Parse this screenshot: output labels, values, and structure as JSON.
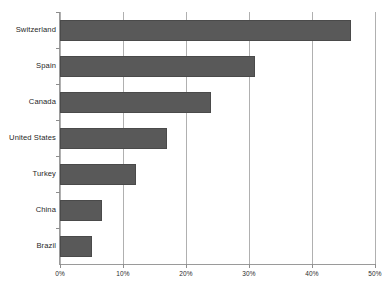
{
  "chart_data": {
    "type": "bar",
    "orientation": "horizontal",
    "title": "",
    "xlabel": "",
    "ylabel": "",
    "categories": [
      "Switzerland",
      "Spain",
      "Canada",
      "United States",
      "Turkey",
      "China",
      "Brazil"
    ],
    "values": [
      46.2,
      31.0,
      24.0,
      17.0,
      12.0,
      6.7,
      5.0
    ],
    "value_format": "percent",
    "xlim": [
      0,
      50
    ],
    "xticks": [
      0,
      10,
      20,
      30,
      40,
      50
    ],
    "xtick_labels": [
      "0%",
      "10%",
      "20%",
      "30%",
      "40%",
      "50%"
    ],
    "grid": "vertical",
    "legend": "none",
    "bar_color": "#595959",
    "bar_edge_color": "#4a4a4a",
    "gridline_color": "#b0b0b0",
    "axis_color": "#9a9a9a",
    "background": "#ffffff"
  },
  "caption": ""
}
